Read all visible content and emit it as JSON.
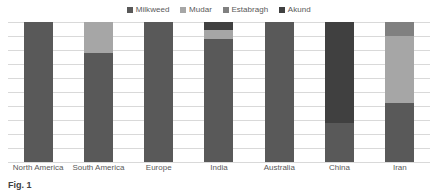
{
  "legend": {
    "position": "top-center",
    "entries": [
      {
        "label": "Milkweed",
        "color": "#595959"
      },
      {
        "label": "Mudar",
        "color": "#a6a6a6"
      },
      {
        "label": "Estabragh",
        "color": "#808080"
      },
      {
        "label": "Akund",
        "color": "#404040"
      }
    ]
  },
  "caption": {
    "label": "Fig. 1",
    "text": ""
  },
  "chart_data": {
    "type": "bar",
    "subtype": "100% stacked column",
    "title": "",
    "subtitle": "",
    "xlabel": "",
    "ylabel": "",
    "ylim": [
      0,
      100
    ],
    "grid": true,
    "gridline_count": 10,
    "legend_position": "top",
    "categories": [
      "North America",
      "South America",
      "Europe",
      "India",
      "Australia",
      "China",
      "Iran"
    ],
    "series": [
      {
        "name": "Milkweed",
        "color": "#595959",
        "values": [
          100,
          78,
          100,
          88,
          100,
          28,
          42
        ]
      },
      {
        "name": "Mudar",
        "color": "#a6a6a6",
        "values": [
          0,
          22,
          0,
          6,
          0,
          0,
          48
        ]
      },
      {
        "name": "Estabragh",
        "color": "#808080",
        "values": [
          0,
          0,
          0,
          0,
          0,
          0,
          10
        ]
      },
      {
        "name": "Akund",
        "color": "#404040",
        "values": [
          0,
          0,
          0,
          6,
          0,
          72,
          0
        ]
      }
    ]
  }
}
